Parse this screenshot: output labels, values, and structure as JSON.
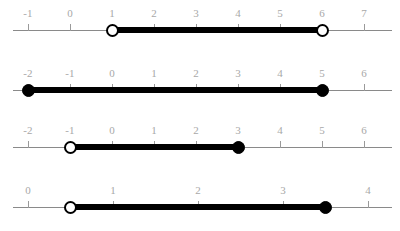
{
  "chart_data": {
    "type": "numberline",
    "title": "",
    "xlabel": "",
    "ylabel": "",
    "grid": false,
    "legend": null,
    "geometry": {
      "axis_left_px": 13,
      "first_tick_x_px": 28,
      "tick_length_px": 7,
      "segment_thickness_px": 6,
      "endpoint_diameter_px": 13
    },
    "lines": [
      {
        "id": "line-1",
        "axis_y_px": 30,
        "tick_spacing_px": 42,
        "axis_start_px": 13,
        "axis_end_px": 392,
        "ticks": [
          -1,
          0,
          1,
          2,
          3,
          4,
          5,
          6,
          7
        ],
        "tick_labels": [
          "-1",
          "0",
          "1",
          "2",
          "3",
          "4",
          "5",
          "6",
          "7"
        ],
        "interval": {
          "start": 1,
          "end": 6,
          "start_type": "open",
          "end_type": "open",
          "notation": "(1, 6)",
          "inequality": "1 < x < 6"
        }
      },
      {
        "id": "line-2",
        "axis_y_px": 90,
        "tick_spacing_px": 42,
        "axis_start_px": 13,
        "axis_end_px": 392,
        "ticks": [
          -2,
          -1,
          0,
          1,
          2,
          3,
          4,
          5,
          6
        ],
        "tick_labels": [
          "-2",
          "-1",
          "0",
          "1",
          "2",
          "3",
          "4",
          "5",
          "6"
        ],
        "interval": {
          "start": -2,
          "end": 5,
          "start_type": "closed",
          "end_type": "closed",
          "notation": "[-2, 5]",
          "inequality": "-2 <= x <= 5"
        }
      },
      {
        "id": "line-3",
        "axis_y_px": 147,
        "tick_spacing_px": 42,
        "axis_start_px": 13,
        "axis_end_px": 392,
        "ticks": [
          -2,
          -1,
          0,
          1,
          2,
          3,
          4,
          5,
          6
        ],
        "tick_labels": [
          "-2",
          "-1",
          "0",
          "1",
          "2",
          "3",
          "4",
          "5",
          "6"
        ],
        "interval": {
          "start": -1,
          "end": 3,
          "start_type": "open",
          "end_type": "closed",
          "notation": "(-1, 3]",
          "inequality": "-1 < x <= 3"
        }
      },
      {
        "id": "line-4",
        "axis_y_px": 207,
        "tick_spacing_px": 85,
        "axis_start_px": 13,
        "axis_end_px": 392,
        "ticks": [
          0,
          1,
          2,
          3,
          4
        ],
        "tick_labels": [
          "0",
          "1",
          "2",
          "3",
          "4"
        ],
        "interval": {
          "start": 0.5,
          "end": 3.5,
          "start_type": "open",
          "end_type": "closed",
          "notation": "(0.5, 3.5]",
          "inequality": "0.5 < x <= 3.5"
        }
      }
    ]
  },
  "colors": {
    "background": "#ffffff",
    "axis": "#8a8a8a",
    "tick": "#9a9a9a",
    "tick_label": "#a8a8a8",
    "segment": "#000000",
    "endpoint_fill_closed": "#000000",
    "endpoint_fill_open": "#ffffff",
    "endpoint_stroke": "#000000"
  }
}
